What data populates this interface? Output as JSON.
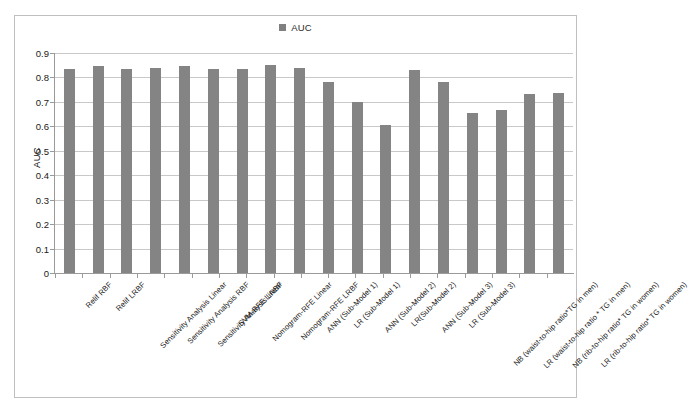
{
  "chart_data": {
    "type": "bar",
    "title": "",
    "legend": [
      "AUC"
    ],
    "legend_position": "top-center",
    "series_name": "AUC",
    "xlabel": "",
    "ylabel": "AUC",
    "ylim": [
      0,
      0.9
    ],
    "ytick_labels": [
      "0.9",
      "0.8",
      "0.7",
      "0.6",
      "0.5",
      "0.4",
      "0.3",
      "0.2",
      "0.1",
      "0"
    ],
    "ytick_values": [
      0.9,
      0.8,
      0.7,
      0.6,
      0.5,
      0.4,
      0.3,
      0.2,
      0.1,
      0
    ],
    "grid": true,
    "bar_color": "#848484",
    "categories": [
      "Relif RBF",
      "Relif LRBF",
      "Sensitivity Analysis Linear",
      "Sensitivity Analysis RBF",
      "Sensitivity Analysis LRBF",
      "SVM-RFE Linear",
      "Nomogram-RFE Linear",
      "Nomogram-RFE LRBF",
      "ANN (Sub-Model 1)",
      "LR (Sub-Model 1)",
      "ANN (Sub-Model 2)",
      "LR(Sub-Model 2)",
      "ANN (Sub-Model 3)",
      "LR (Sub-Model 3)",
      "NB (waist-to-hip ratio*TG in men)",
      "LR (waist-to-hip ratio * TG in men)",
      "NB (rib-to-hip ratio* TG in women)",
      "LR (rib-to-hip ratio* TG in women)"
    ],
    "values": [
      0.835,
      0.845,
      0.833,
      0.837,
      0.845,
      0.833,
      0.833,
      0.85,
      0.838,
      0.78,
      0.7,
      0.605,
      0.83,
      0.78,
      0.655,
      0.665,
      0.733,
      0.737
    ]
  }
}
